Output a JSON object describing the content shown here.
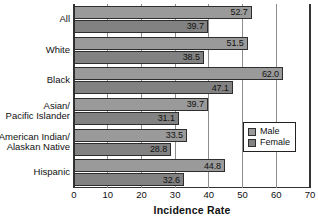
{
  "chart_data": {
    "type": "bar",
    "orientation": "horizontal",
    "title": "",
    "xlabel": "Incidence Rate",
    "ylabel": "",
    "xlim": [
      0,
      70
    ],
    "xticks": [
      0,
      10,
      20,
      30,
      40,
      50,
      60,
      70
    ],
    "xtick_labels": [
      "0",
      "10",
      "20",
      "30",
      "40",
      "50",
      "60",
      "70"
    ],
    "grid": true,
    "legend_position": "right-inside",
    "categories": [
      "All",
      "White",
      "Black",
      "Asian/\nPacific Islander",
      "American Indian/\nAlaskan Native",
      "Hispanic"
    ],
    "series": [
      {
        "name": "Male",
        "color": "#9a9a9a",
        "values": [
          52.7,
          51.5,
          62.0,
          39.7,
          33.5,
          44.8
        ],
        "value_labels": [
          "52.7",
          "51.5",
          "62.0",
          "39.7",
          "33.5",
          "44.8"
        ]
      },
      {
        "name": "Female",
        "color": "#828282",
        "values": [
          39.7,
          38.5,
          47.1,
          31.1,
          28.8,
          32.6
        ],
        "value_labels": [
          "39.7",
          "38.5",
          "47.1",
          "31.1",
          "28.8",
          "32.6"
        ]
      }
    ]
  },
  "legend": {
    "entries": [
      {
        "label": "Male"
      },
      {
        "label": "Female"
      }
    ]
  }
}
